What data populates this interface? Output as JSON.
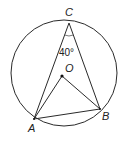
{
  "diagram": {
    "type": "circle-geometry",
    "circle": {
      "cx": 64,
      "cy": 73,
      "r": 53
    },
    "points": {
      "C": {
        "label": "C",
        "x": 69,
        "y": 23
      },
      "O": {
        "label": "O",
        "x": 62,
        "y": 76
      },
      "A": {
        "label": "A",
        "x": 34,
        "y": 119
      },
      "B": {
        "label": "B",
        "x": 100,
        "y": 109
      }
    },
    "angle_label": "40°",
    "segments": [
      "CA",
      "CB",
      "AB",
      "OA",
      "OB"
    ],
    "stroke_color": "#2a2a2a"
  }
}
